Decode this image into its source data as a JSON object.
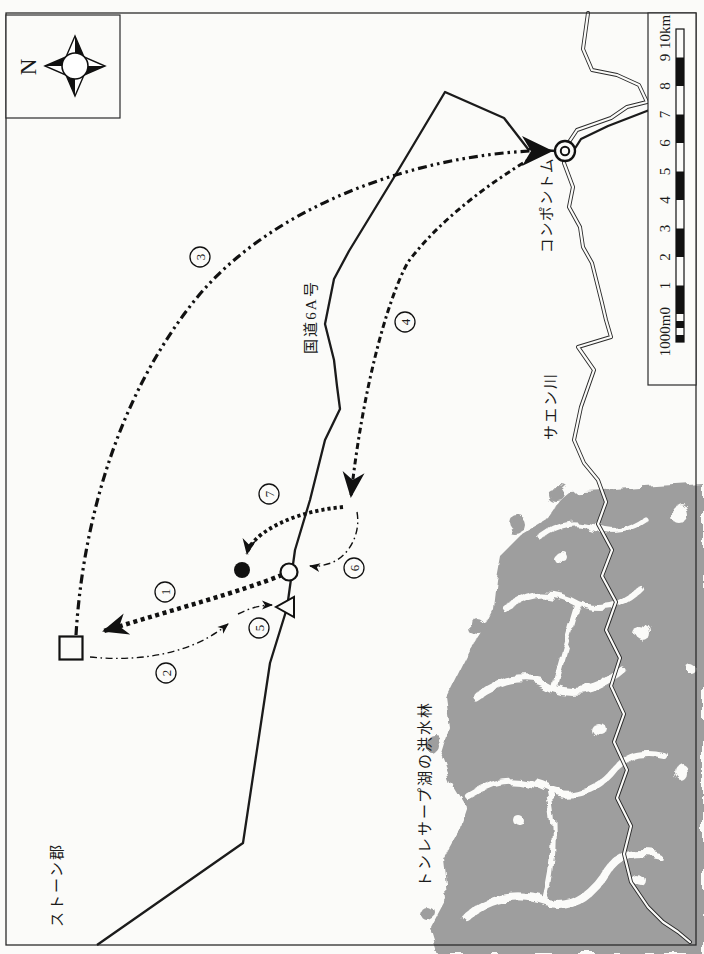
{
  "compass": {
    "north_label": "N"
  },
  "scalebar": {
    "labels": [
      "1000m0",
      "1",
      "2",
      "3",
      "4",
      "5",
      "6",
      "7",
      "8",
      "9",
      "10km"
    ]
  },
  "places": {
    "kompong_thom": "コンポントム",
    "saen_river": "サエン川",
    "national_route_6a": "国道6A号",
    "tonle_sap_flooded_forest": "トンレサープ湖の洪水林",
    "stoung_district": "ストーン郡"
  },
  "routes": [
    {
      "number": "1"
    },
    {
      "number": "2"
    },
    {
      "number": "3"
    },
    {
      "number": "4"
    },
    {
      "number": "5"
    },
    {
      "number": "6"
    },
    {
      "number": "7"
    }
  ],
  "colors": {
    "forest_gray": "#9e9e9e",
    "ink": "#1b1b1b",
    "paper": "#fbfbf9"
  }
}
